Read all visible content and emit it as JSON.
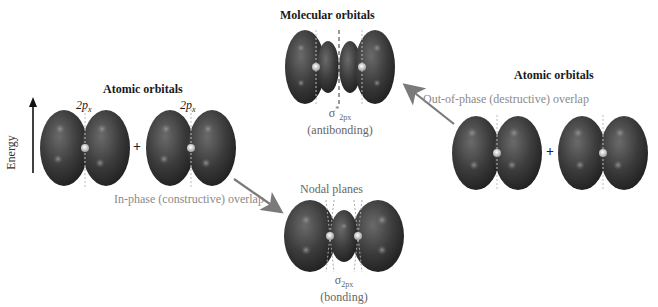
{
  "diagram": {
    "axis": {
      "label": "Energy",
      "direction": "up"
    },
    "left_group": {
      "title": "Atomic orbitals",
      "orbital_labels": [
        "2px",
        "2px"
      ],
      "orbital_label_main": "2p",
      "orbital_label_sub": "x",
      "operator": "+"
    },
    "right_group": {
      "title": "Atomic orbitals",
      "operator": "+"
    },
    "top_group": {
      "title": "Molecular orbitals",
      "symbol_main": "σ",
      "symbol_sup": "*",
      "symbol_sub": "2px",
      "description": "(antibonding)"
    },
    "bottom_group": {
      "annotation": "Nodal planes",
      "symbol_main": "σ",
      "symbol_sub": "2px",
      "description": "(bonding)"
    },
    "arrows": {
      "in_phase": "In-phase (constructive) overlap",
      "out_of_phase": "Out-of-phase (destructive) overlap"
    },
    "colors": {
      "lobe": "#3a3a3a",
      "lobe_highlight": "#6e6e6e",
      "arrow": "#7a7a7a",
      "caption": "#8a8a8a"
    }
  }
}
